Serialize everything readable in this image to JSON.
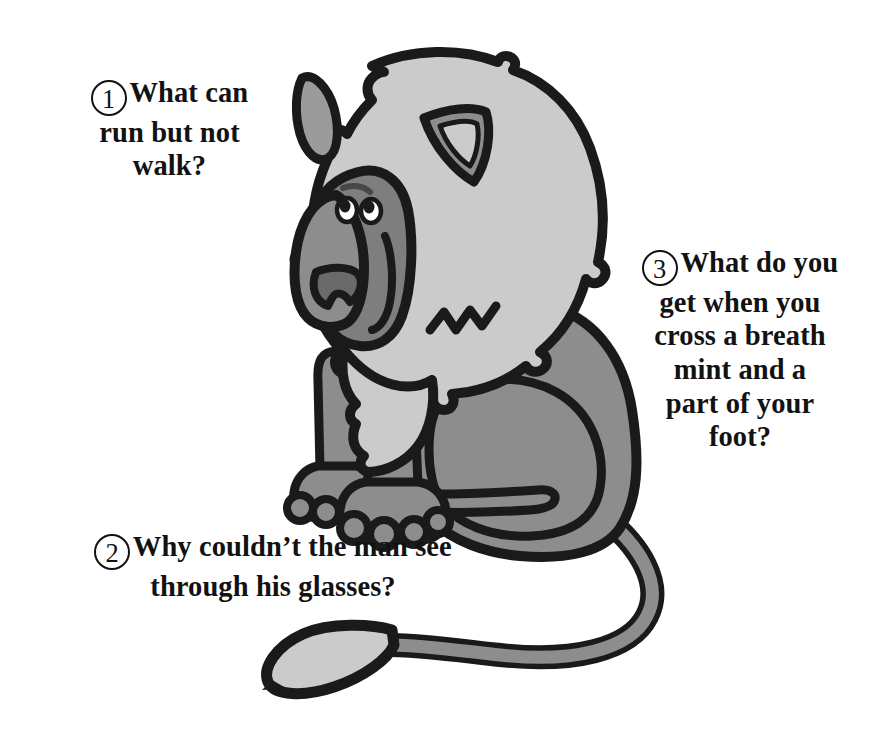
{
  "page": {
    "background_color": "#ffffff",
    "kind": "illustrated-riddle-page"
  },
  "illustration": {
    "name": "seated-baboon-cartoon",
    "description": "Cartoon grey baboon sitting in profile facing left with a large pale mane, long muzzle, and a long curving tail ending in a light tuft",
    "colors": {
      "outline": "#1a1a1a",
      "mane": "#cbcbcb",
      "body": "#8d8d8d",
      "muzzle": "#7e7e7e",
      "nose": "#6a6a6a",
      "ear_inner": "#8d8d8d",
      "tail_tuft": "#cbcbcb",
      "eye_white": "#ffffff",
      "pupil": "#1a1a1a"
    }
  },
  "riddles": [
    {
      "number": "1",
      "lines": [
        "What can",
        "run but not",
        "walk?"
      ],
      "text": "What can run but not walk?"
    },
    {
      "number": "2",
      "lines": [
        "Why couldn’t the man see",
        "through his glasses?"
      ],
      "text": "Why couldn’t the man see through his glasses?"
    },
    {
      "number": "3",
      "lines": [
        "What do you",
        "get when you",
        "cross a breath",
        "mint and a",
        "part of your",
        "foot?"
      ],
      "text": "What do you get when you cross a breath mint and a part of your foot?"
    }
  ]
}
